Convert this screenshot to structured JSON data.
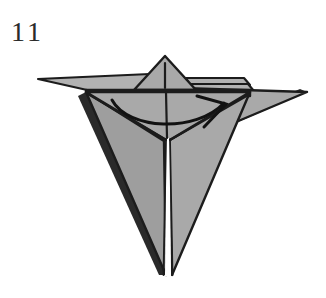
{
  "figure": {
    "step_number": "11",
    "colors": {
      "paper_fill": "#a9a9a9",
      "paper_fill_shadow": "#9a9a9a",
      "paper_fill_light": "#b4b4b4",
      "outline": "#1c1c1c",
      "crease": "#1c1c1c",
      "background": "#ffffff",
      "step_number_color": "#2b2b2b"
    },
    "elements": {
      "top_peak_label": "top-peak-flap",
      "left_wing_label": "left-wing-flap",
      "right_wing_label": "right-wing-flap",
      "body_label": "central-body-point",
      "arrow_label": "fold-arrow",
      "center_crease_label": "center-vertical-crease"
    },
    "arrow": {
      "type": "curved-fold-arrow",
      "direction": "left-to-right",
      "start_x": 112,
      "start_y": 100,
      "end_x": 226,
      "end_y": 104
    }
  }
}
